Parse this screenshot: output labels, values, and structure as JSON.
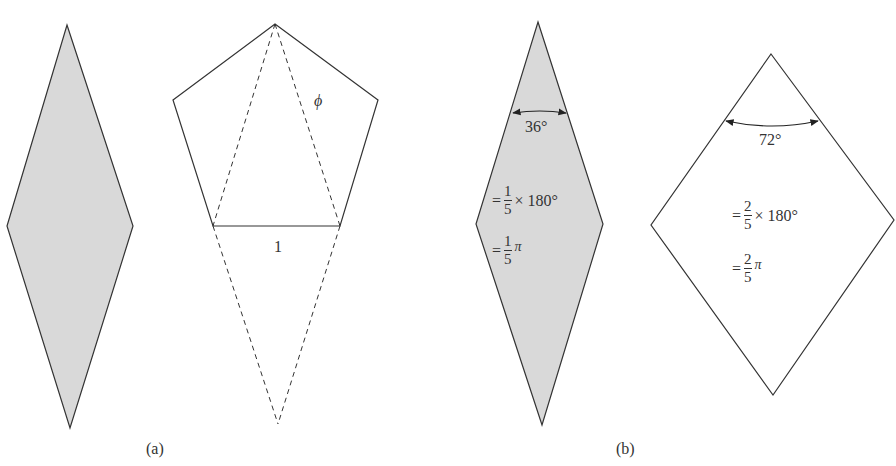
{
  "figure": {
    "panel_a": {
      "caption": "(a)",
      "pentagon_side_label": "1",
      "diagonal_label": "ϕ"
    },
    "panel_b": {
      "caption": "(b)",
      "thin_rhombus": {
        "angle_label": "36°",
        "eq1": {
          "prefix": "=",
          "num": "1",
          "den": "5",
          "suffix": "× 180°"
        },
        "eq2": {
          "prefix": "=",
          "num": "1",
          "den": "5",
          "suffix": "π"
        }
      },
      "thick_rhombus": {
        "angle_label": "72°",
        "eq1": {
          "prefix": "=",
          "num": "2",
          "den": "5",
          "suffix": "× 180°"
        },
        "eq2": {
          "prefix": "=",
          "num": "2",
          "den": "5",
          "suffix": "π"
        }
      }
    },
    "colors": {
      "shade": "#d9d9d9",
      "stroke": "#333333"
    }
  }
}
